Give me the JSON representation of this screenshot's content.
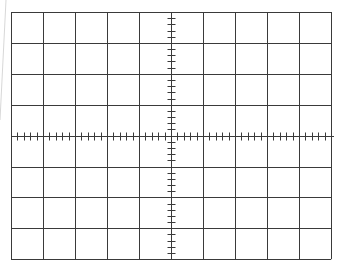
{
  "graticule": {
    "type": "oscilloscope-graticule",
    "columns": 10,
    "rows": 8,
    "minor_ticks_per_division": 5,
    "origin": {
      "x": 11,
      "y": 12
    },
    "division_width": 32,
    "division_height": 30.9,
    "line_color": "#3a3a3a",
    "background_color": "#ffffff",
    "edge_shadow_color": "#d8d8d8"
  }
}
